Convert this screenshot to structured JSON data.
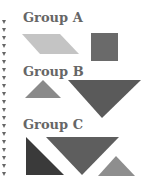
{
  "groups": [
    {
      "label": "Group A",
      "shapes": [
        "light-gray parallelogram",
        "dark-gray square"
      ]
    },
    {
      "label": "Group B",
      "shapes": [
        "small gray triangle",
        "large dark inverted triangle"
      ]
    },
    {
      "label": "Group C",
      "shapes": [
        "dark right triangle",
        "dark inverted triangle",
        "small gray triangle"
      ]
    }
  ],
  "colors": {
    "light": "#c4c4c4",
    "mid": "#8a8a8a",
    "dark": "#5a5a5a",
    "darker": "#3a3a3a",
    "text": "#666666"
  }
}
